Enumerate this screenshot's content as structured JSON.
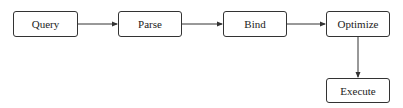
{
  "diagram": {
    "type": "flowchart",
    "nodes": [
      {
        "id": "query",
        "label": "Query"
      },
      {
        "id": "parse",
        "label": "Parse"
      },
      {
        "id": "bind",
        "label": "Bind"
      },
      {
        "id": "optimize",
        "label": "Optimize"
      },
      {
        "id": "execute",
        "label": "Execute"
      }
    ],
    "edges": [
      {
        "from": "query",
        "to": "parse"
      },
      {
        "from": "parse",
        "to": "bind"
      },
      {
        "from": "bind",
        "to": "optimize"
      },
      {
        "from": "optimize",
        "to": "execute"
      }
    ],
    "colors": {
      "stroke": "#333333",
      "background": "#ffffff",
      "text": "#222222"
    }
  }
}
